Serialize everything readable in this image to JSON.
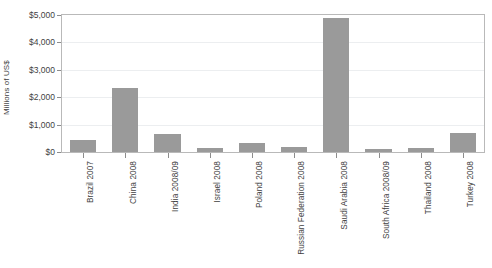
{
  "chart_data": {
    "type": "bar",
    "title": "",
    "xlabel": "",
    "ylabel": "Millions of US$",
    "categories": [
      "Brazil 2007",
      "China 2008",
      "India 2008/09",
      "Israel 2008",
      "Poland 2008",
      "Russian Federation 2008",
      "Saudi Arabia 2008",
      "South Africa 2008/09",
      "Thailand 2008",
      "Turkey 2008"
    ],
    "values": [
      430,
      2350,
      650,
      140,
      330,
      175,
      4900,
      105,
      145,
      700
    ],
    "ylim": [
      0,
      5000
    ],
    "ytick_values": [
      0,
      1000,
      2000,
      3000,
      4000,
      5000
    ],
    "ytick_labels": [
      "$0",
      "$1,000",
      "$2,000",
      "$3,000",
      "$4,000",
      "$5,000"
    ],
    "grid": true,
    "legend": "none",
    "bar_color": "#9a9a9a",
    "axis_color": "#b9b9b9",
    "grid_color": "#eceef0"
  },
  "figure": {
    "top_caption_fragment": "",
    "bottom_caption_fragment": ""
  }
}
